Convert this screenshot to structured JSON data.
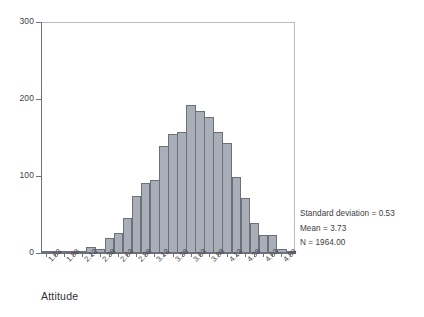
{
  "chart_data": {
    "type": "bar",
    "title": "",
    "subtitle": "",
    "xlabel": "Attitude",
    "ylabel": "",
    "ylim": [
      0,
      300
    ],
    "yticks": [
      0,
      100,
      200,
      300
    ],
    "grid": false,
    "legend": null,
    "bin_width": 0.125,
    "categories": [
      "1.63",
      "1.75",
      "1.88",
      "2.00",
      "2.13",
      "2.25",
      "2.38",
      "2.50",
      "2.63",
      "2.75",
      "2.88",
      "3.00",
      "3.13",
      "3.25",
      "3.38",
      "3.50",
      "3.63",
      "3.75",
      "3.88",
      "4.00",
      "4.13",
      "4.25",
      "4.38",
      "4.50",
      "4.63",
      "4.75",
      "4.88",
      "5.00"
    ],
    "values": [
      1,
      1,
      3,
      2,
      3,
      8,
      5,
      19,
      26,
      46,
      74,
      91,
      95,
      139,
      154,
      157,
      192,
      185,
      176,
      157,
      143,
      99,
      72,
      39,
      23,
      23,
      5,
      1
    ],
    "tick_labels": [
      "1.63",
      "1.88",
      "2.13",
      "2.38",
      "2.63",
      "2.88",
      "3.13",
      "3.38",
      "3.63",
      "3.88",
      "4.13",
      "4.38",
      "4.63",
      "4.88"
    ],
    "tick_label_step": 2,
    "annotations": [
      "Standard deviation = 0.53",
      "Mean = 3.73",
      "N = 1964.00"
    ],
    "statistics": {
      "standard_deviation_label": "Standard deviation = 0.53",
      "standard_deviation": 0.53,
      "mean_label": "Mean = 3.73",
      "mean": 3.73,
      "n_label": "N = 1964.00",
      "n": 1964.0
    },
    "colors": {
      "bar_fill": "#a9aeb8",
      "bar_edge": "#6c7079",
      "axis": "#6f7379",
      "frame": "#b9bcc0",
      "text": "#3a3c42",
      "background": "#ffffff"
    }
  }
}
